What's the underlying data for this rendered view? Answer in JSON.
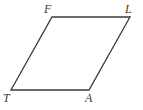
{
  "figure": {
    "name": "parallelogram-FLAT",
    "shape_type": "parallelogram",
    "background_color": "#ffffff",
    "stroke_color": "#3a3a3a",
    "stroke_width": 1.3,
    "fill_color": "none",
    "canvas": {
      "width": 143,
      "height": 110
    },
    "vertices": [
      {
        "id": "F",
        "label": "F",
        "x": 52,
        "y": 17
      },
      {
        "id": "L",
        "label": "L",
        "x": 130,
        "y": 17
      },
      {
        "id": "A",
        "label": "A",
        "x": 89,
        "y": 90
      },
      {
        "id": "T",
        "label": "T",
        "x": 11,
        "y": 90
      }
    ],
    "polygon_points": "52,17 130,17 89,90 11,90",
    "edges": [
      {
        "id": "FL",
        "from": "F",
        "to": "L",
        "label": ""
      },
      {
        "id": "LA",
        "from": "L",
        "to": "A",
        "label": ""
      },
      {
        "id": "AT",
        "from": "A",
        "to": "T",
        "label": ""
      },
      {
        "id": "TF",
        "from": "T",
        "to": "F",
        "label": ""
      }
    ],
    "labels": {
      "F": "F",
      "L": "L",
      "A": "A",
      "T": "T"
    }
  }
}
